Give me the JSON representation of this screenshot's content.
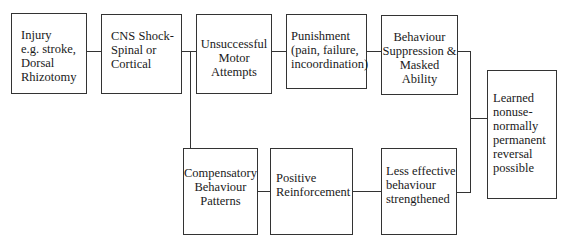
{
  "diagram": {
    "type": "flowchart",
    "nodes": [
      {
        "id": "injury",
        "label": "Injury\ne.g. stroke,\nDorsal\nRhizotomy"
      },
      {
        "id": "cns_shock",
        "label": "CNS Shock-\nSpinal or\nCortical"
      },
      {
        "id": "unsuccessful",
        "label": "Unsuccessful\nMotor\nAttempts"
      },
      {
        "id": "punishment",
        "label": "Punishment\n(pain,  failure,\nincoordination)"
      },
      {
        "id": "suppression",
        "label": "Behaviour\nSuppression &\nMasked\nAbility"
      },
      {
        "id": "learned_nonuse",
        "label": "Learned\nnonuse-\nnormally\npermanent\nreversal\npossible"
      },
      {
        "id": "compensatory",
        "label": "Compensatory\nBehaviour\nPatterns"
      },
      {
        "id": "positive",
        "label": "Positive\nReinforcement"
      },
      {
        "id": "less_effective",
        "label": "Less effective\nbehaviour\nstrengthened"
      }
    ],
    "edges": [
      {
        "from": "injury",
        "to": "cns_shock"
      },
      {
        "from": "cns_shock",
        "to": "unsuccessful"
      },
      {
        "from": "cns_shock",
        "to": "compensatory"
      },
      {
        "from": "unsuccessful",
        "to": "punishment"
      },
      {
        "from": "punishment",
        "to": "suppression"
      },
      {
        "from": "suppression",
        "to": "learned_nonuse"
      },
      {
        "from": "compensatory",
        "to": "positive"
      },
      {
        "from": "positive",
        "to": "less_effective"
      },
      {
        "from": "less_effective",
        "to": "learned_nonuse"
      }
    ]
  }
}
